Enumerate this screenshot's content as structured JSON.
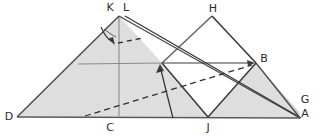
{
  "figure": {
    "canvas": {
      "width": 323,
      "height": 137
    },
    "colors": {
      "background": "#ffffff",
      "shade_fill": "#dedede",
      "stroke_dark": "#3a3a3a",
      "stroke_gray": "#8a8a8a",
      "label_color": "#2b2b2b",
      "dashed_color": "#2f2f2f",
      "arrow_color": "#3a3a3a"
    },
    "vertex_labels": [
      {
        "name": "K",
        "text": "K",
        "x": 110,
        "y": 11
      },
      {
        "name": "L",
        "text": "L",
        "x": 126,
        "y": 11
      },
      {
        "name": "H",
        "text": "H",
        "x": 213,
        "y": 12
      },
      {
        "name": "B",
        "text": "B",
        "x": 264,
        "y": 62
      },
      {
        "name": "G",
        "text": "G",
        "x": 303,
        "y": 103
      },
      {
        "name": "A",
        "text": "A",
        "x": 303,
        "y": 117
      },
      {
        "name": "D",
        "text": "D",
        "x": 10,
        "y": 119
      },
      {
        "name": "C",
        "text": "C",
        "x": 110,
        "y": 130
      },
      {
        "name": "J",
        "text": "J",
        "x": 207,
        "y": 130
      }
    ],
    "points": {
      "K": [
        117,
        16
      ],
      "L": [
        123,
        16
      ],
      "H": [
        212,
        16
      ],
      "B": [
        256,
        63
      ],
      "G": [
        299,
        112
      ],
      "A": [
        300,
        118
      ],
      "D": [
        17,
        117
      ],
      "C": [
        118,
        117
      ],
      "J": [
        208,
        117
      ],
      "I": [
        162,
        63
      ],
      "apex_left": [
        119,
        16
      ],
      "arc_arrow_tip": [
        160,
        66
      ],
      "small_arrow_tip": [
        113,
        43
      ]
    },
    "shaded_regions": [
      {
        "name": "left-large-triangle",
        "points": "119,16 162,63 208,117 17,117"
      },
      {
        "name": "right-small-triangle",
        "points": "208,117 256,63 300,118"
      },
      {
        "name": "right-sliver",
        "points": "256,63 300,118 299,112"
      }
    ],
    "solid_edges": [
      {
        "name": "edge-D-apex",
        "from": [
          17,
          117
        ],
        "to": [
          119,
          16
        ]
      },
      {
        "name": "edge-apex-A",
        "from": [
          119,
          16
        ],
        "to": [
          300,
          118
        ]
      },
      {
        "name": "edge-L-A",
        "from": [
          125,
          16
        ],
        "to": [
          301,
          118
        ]
      },
      {
        "name": "edge-D-A-base",
        "from": [
          17,
          117
        ],
        "to": [
          300,
          118
        ]
      },
      {
        "name": "edge-I-H",
        "from": [
          162,
          63
        ],
        "to": [
          212,
          16
        ]
      },
      {
        "name": "edge-H-B",
        "from": [
          212,
          16
        ],
        "to": [
          256,
          63
        ]
      },
      {
        "name": "edge-I-J",
        "from": [
          162,
          63
        ],
        "to": [
          208,
          117
        ]
      },
      {
        "name": "edge-J-B",
        "from": [
          208,
          117
        ],
        "to": [
          256,
          63
        ]
      },
      {
        "name": "edge-B-A",
        "from": [
          256,
          63
        ],
        "to": [
          300,
          118
        ]
      }
    ],
    "gray_lines": [
      {
        "name": "horizontal-midline",
        "from": [
          78,
          64
        ],
        "to": [
          162,
          63
        ]
      },
      {
        "name": "vertical-altitude",
        "from": [
          119,
          17
        ],
        "to": [
          119,
          116
        ]
      }
    ],
    "dashed_lines": [
      {
        "name": "long-dashed-C-to-B",
        "from": [
          85,
          116
        ],
        "to": [
          254,
          64
        ]
      },
      {
        "name": "short-dashed-apex",
        "from": [
          118,
          43
        ],
        "to": [
          143,
          38
        ]
      }
    ],
    "arrows": [
      {
        "name": "arrow-horizontal-to-B",
        "from": [
          162,
          63
        ],
        "to": [
          254,
          63
        ],
        "style": "straight"
      },
      {
        "name": "arrow-curved-down-apex",
        "from": [
          103,
          30
        ],
        "to": [
          114,
          44
        ],
        "style": "curved"
      },
      {
        "name": "arrow-arc-up-to-I",
        "from": [
          174,
          118
        ],
        "to": [
          161,
          66
        ],
        "style": "arc"
      }
    ]
  }
}
